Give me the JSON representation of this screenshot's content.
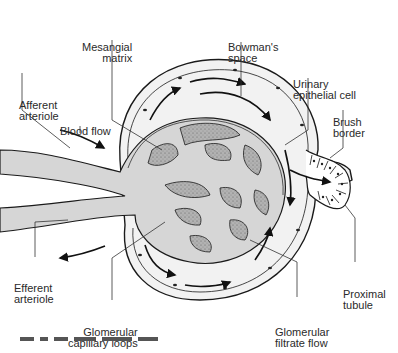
{
  "diagram": {
    "labels": {
      "mesangial_matrix": [
        "Mesangial",
        "matrix"
      ],
      "bowmans_space": [
        "Bowman's",
        "space"
      ],
      "urinary_epithelial_cell": [
        "Urinary",
        "epithelial cell"
      ],
      "afferent_arteriole": [
        "Afferent",
        "arteriole"
      ],
      "blood_flow": [
        "Blood flow"
      ],
      "brush_border": [
        "Brush",
        "border"
      ],
      "efferent_arteriole": [
        "Efferent",
        "arteriole"
      ],
      "proximal_tubule": [
        "Proximal",
        "tubule"
      ],
      "glomerular_capillary_loops": [
        "Glomerular",
        "capillary loops"
      ],
      "glomerular_filtrate_flow": [
        "Glomerular",
        "filtrate flow"
      ]
    },
    "colors": {
      "capillary_fill": "#d6d6d6",
      "mesangium_fill": "#a8a8a8",
      "capsule_space": "#f2f2f2",
      "line": "#1a1a1a"
    }
  }
}
